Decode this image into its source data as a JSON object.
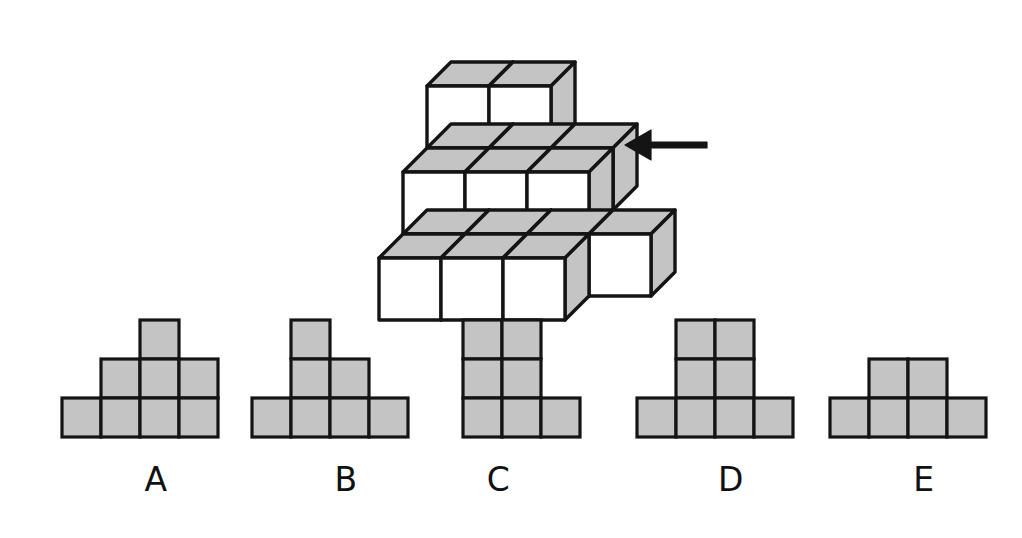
{
  "page": {
    "type": "spatial-reasoning-question",
    "background_color": "#ffffff",
    "line_color": "#141414",
    "fill_gray": "#c4c4c4",
    "fill_gray_dark": "#b0b0b0",
    "fill_white": "#ffffff",
    "width": 1022,
    "height": 538
  },
  "figure": {
    "name": "isometric-cube-stack",
    "arrow": {
      "icon": "arrow-left-icon",
      "direction": "left",
      "color": "#141414",
      "x": 625,
      "y": 145,
      "length": 82,
      "meaning": "viewing direction"
    },
    "cubes": [
      {
        "col": 0,
        "row": 0,
        "layer": 0
      },
      {
        "col": 1,
        "row": 0,
        "layer": 0
      },
      {
        "col": 2,
        "row": 0,
        "layer": 0
      },
      {
        "col": 0,
        "row": 1,
        "layer": 0
      },
      {
        "col": 1,
        "row": 1,
        "layer": 0
      },
      {
        "col": 2,
        "row": 1,
        "layer": 0
      },
      {
        "col": 3,
        "row": 1,
        "layer": 0
      },
      {
        "col": 0,
        "row": 1,
        "layer": 1
      },
      {
        "col": 1,
        "row": 1,
        "layer": 1
      },
      {
        "col": 2,
        "row": 1,
        "layer": 1
      },
      {
        "col": 0,
        "row": 2,
        "layer": 1
      },
      {
        "col": 1,
        "row": 2,
        "layer": 1
      },
      {
        "col": 2,
        "row": 2,
        "layer": 1
      },
      {
        "col": 0,
        "row": 2,
        "layer": 2
      },
      {
        "col": 1,
        "row": 2,
        "layer": 2
      }
    ],
    "cube_size": 62,
    "depth": 24,
    "origin_x": 379,
    "origin_y": 258
  },
  "options": [
    {
      "id": "A",
      "label": "A",
      "name": "option-a",
      "cols": 4,
      "rows": 3,
      "cell": 39,
      "x": 62,
      "y": 320,
      "label_x": 78,
      "label_y": 460,
      "cells": [
        [
          0,
          0,
          1,
          0
        ],
        [
          0,
          1,
          1,
          1
        ],
        [
          1,
          1,
          1,
          1
        ]
      ]
    },
    {
      "id": "B",
      "label": "B",
      "name": "option-b",
      "cols": 4,
      "rows": 3,
      "cell": 39,
      "x": 252,
      "y": 320,
      "label_x": 268,
      "label_y": 460,
      "cells": [
        [
          0,
          1,
          0,
          0
        ],
        [
          0,
          1,
          1,
          0
        ],
        [
          1,
          1,
          1,
          1
        ]
      ]
    },
    {
      "id": "C",
      "label": "C",
      "name": "option-c",
      "cols": 3,
      "rows": 3,
      "cell": 39,
      "x": 463,
      "y": 320,
      "label_x": 440,
      "label_y": 460,
      "cells": [
        [
          1,
          1,
          0
        ],
        [
          1,
          1,
          0
        ],
        [
          1,
          1,
          1
        ]
      ]
    },
    {
      "id": "D",
      "label": "D",
      "name": "option-d",
      "cols": 4,
      "rows": 3,
      "cell": 39,
      "x": 637,
      "y": 320,
      "label_x": 653,
      "label_y": 460,
      "cells": [
        [
          0,
          1,
          1,
          0
        ],
        [
          0,
          1,
          1,
          0
        ],
        [
          1,
          1,
          1,
          1
        ]
      ]
    },
    {
      "id": "E",
      "label": "E",
      "name": "option-e",
      "cols": 4,
      "rows": 3,
      "cell": 39,
      "x": 830,
      "y": 320,
      "label_x": 846,
      "label_y": 460,
      "cells": [
        [
          0,
          0,
          0,
          0
        ],
        [
          0,
          1,
          1,
          0
        ],
        [
          1,
          1,
          1,
          1
        ]
      ]
    }
  ]
}
